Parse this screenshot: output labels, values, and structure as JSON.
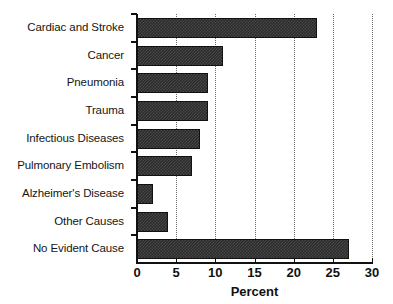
{
  "chart_data": {
    "type": "bar",
    "orientation": "horizontal",
    "title": "",
    "subtitle": "",
    "xlabel": "Percent",
    "ylabel": "",
    "categories": [
      "Cardiac and Stroke",
      "Cancer",
      "Pneumonia",
      "Trauma",
      "Infectious Diseases",
      "Pulmonary Embolism",
      "Alzheimer's Disease",
      "Other Causes",
      "No Evident Cause"
    ],
    "values": [
      23,
      11,
      9,
      9,
      8,
      7,
      2,
      4,
      27
    ],
    "xlim": [
      0,
      30
    ],
    "x_ticks": [
      0,
      5,
      10,
      15,
      20,
      25,
      30
    ],
    "x_tick_labels": [
      "0",
      "5",
      "10",
      "15",
      "20",
      "25",
      "30"
    ],
    "grid": "vertical-dotted",
    "legend": "none",
    "bar_color": "#2b2b2b",
    "bar_pattern": "checkerboard-dither",
    "axis_color": "#111111",
    "gridline_color": "#6a6a6a",
    "background": "#ffffff"
  }
}
